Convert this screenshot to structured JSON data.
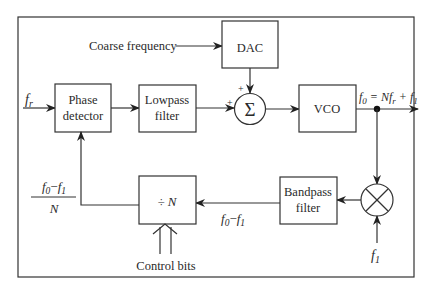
{
  "diagram": {
    "inputs": {
      "reference": "f",
      "reference_sub": "r",
      "coarse_frequency": "Coarse frequency",
      "mixer_lo": "f",
      "mixer_lo_sub": "1",
      "control_bits": "Control bits"
    },
    "blocks": {
      "phase_detector": [
        "Phase",
        "detector"
      ],
      "lowpass_filter": [
        "Lowpass",
        "filter"
      ],
      "dac": "DAC",
      "summer": "Σ",
      "summer_plus_top": "+",
      "summer_plus_left": "+",
      "vco": "VCO",
      "bandpass_filter": [
        "Bandpass",
        "filter"
      ],
      "divider": "÷ N"
    },
    "labels": {
      "output": {
        "f0": "f",
        "f0_sub": "0",
        "eq": " = N",
        "fr": "f",
        "fr_sub": "r",
        "plus": " + ",
        "f1": "f",
        "f1_sub": "1"
      },
      "difference": {
        "f0": "f",
        "f0_sub": "0",
        "minus": "−",
        "f1": "f",
        "f1_sub": "1"
      },
      "fraction": {
        "num_f0": "f",
        "num_f0_sub": "0",
        "num_minus": "−",
        "num_f1": "f",
        "num_f1_sub": "1",
        "den": "N"
      }
    },
    "nodes": [
      "f_r input",
      "Phase detector",
      "Lowpass filter",
      "DAC",
      "Summer",
      "VCO",
      "Output f0 = N fr + f1",
      "Mixer",
      "Bandpass filter",
      "Divide by N"
    ],
    "edges": [
      [
        "f_r input",
        "Phase detector"
      ],
      [
        "Phase detector",
        "Lowpass filter"
      ],
      [
        "Lowpass filter",
        "Summer"
      ],
      [
        "Coarse frequency",
        "DAC"
      ],
      [
        "DAC",
        "Summer"
      ],
      [
        "Summer",
        "VCO"
      ],
      [
        "VCO",
        "Output"
      ],
      [
        "VCO",
        "Mixer"
      ],
      [
        "f1",
        "Mixer"
      ],
      [
        "Mixer",
        "Bandpass filter"
      ],
      [
        "Bandpass filter",
        "Divide by N"
      ],
      [
        "Control bits",
        "Divide by N"
      ],
      [
        "Divide by N",
        "Phase detector"
      ]
    ]
  }
}
